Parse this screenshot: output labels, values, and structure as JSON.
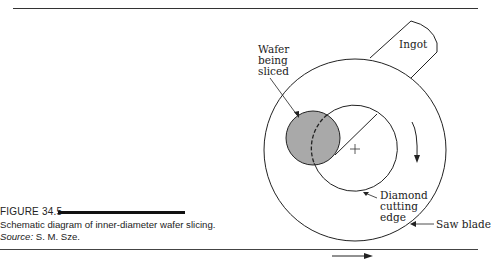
{
  "figure": {
    "number_label": "FIGURE 34.5",
    "caption_main": "Schematic diagram of inner-diameter wafer slicing. ",
    "caption_source_label": "Source:",
    "caption_source_value": " S. M. Sze."
  },
  "diagram": {
    "labels": {
      "wafer_line1": "Wafer",
      "wafer_line2": "being",
      "wafer_line3": "sliced",
      "ingot": "Ingot",
      "diamond_line1": "Diamond",
      "diamond_line2": "cutting",
      "diamond_line3": "edge",
      "saw_blade": "Saw blade"
    },
    "colors": {
      "wafer_fill": "#a9a9a9",
      "line": "#222222"
    }
  }
}
